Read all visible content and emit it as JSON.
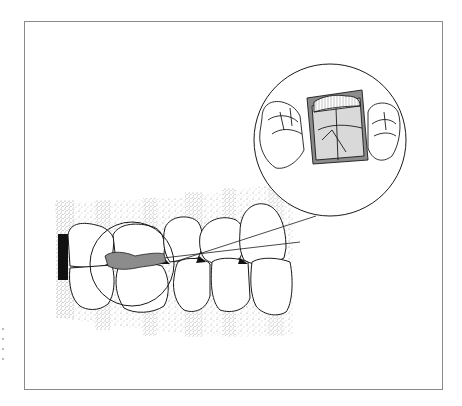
{
  "figure": {
    "type": "dental-illustration",
    "frame": {
      "x": 24,
      "y": 21,
      "width": 418,
      "height": 368,
      "stroke": "#8a8a8a"
    },
    "elements": [
      {
        "id": "gingiva",
        "label": "stippled gingiva background"
      },
      {
        "id": "upper-teeth",
        "label": "maxillary teeth (lateral view)"
      },
      {
        "id": "lower-teeth",
        "label": "mandibular teeth (lateral view)"
      },
      {
        "id": "detail-circle-small",
        "label": "highlighted posterior contact area"
      },
      {
        "id": "detail-circle-large",
        "label": "magnified occlusal view inset"
      },
      {
        "id": "occlusal-record",
        "label": "gray shaded occlusal record / splint material"
      }
    ],
    "colors": {
      "line": "#1a1a1a",
      "shade": "#8c8c8c",
      "light_shade": "#d9d9d9",
      "stipple": "#7a7a7a",
      "black_fill": "#111111"
    }
  }
}
